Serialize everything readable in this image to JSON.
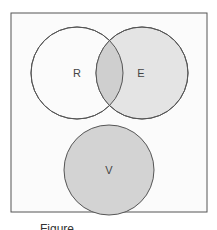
{
  "diagram": {
    "type": "venn",
    "frame": {
      "x": 11,
      "y": 13,
      "width": 196,
      "height": 199,
      "stroke": "#555555",
      "fill": "#fbfbfb"
    },
    "sets": [
      {
        "label": "R",
        "cx": 77,
        "cy": 73,
        "r": 46,
        "fill": "#fbfbfb"
      },
      {
        "label": "E",
        "cx": 142,
        "cy": 73,
        "r": 46,
        "fill": "#e4e4e4"
      },
      {
        "label": "V",
        "cx": 109,
        "cy": 170,
        "r": 45,
        "fill": "#d3d3d3"
      }
    ],
    "intersection_fill": "#cfcfcf",
    "stroke": "#555555",
    "caption": "Figure ..."
  }
}
